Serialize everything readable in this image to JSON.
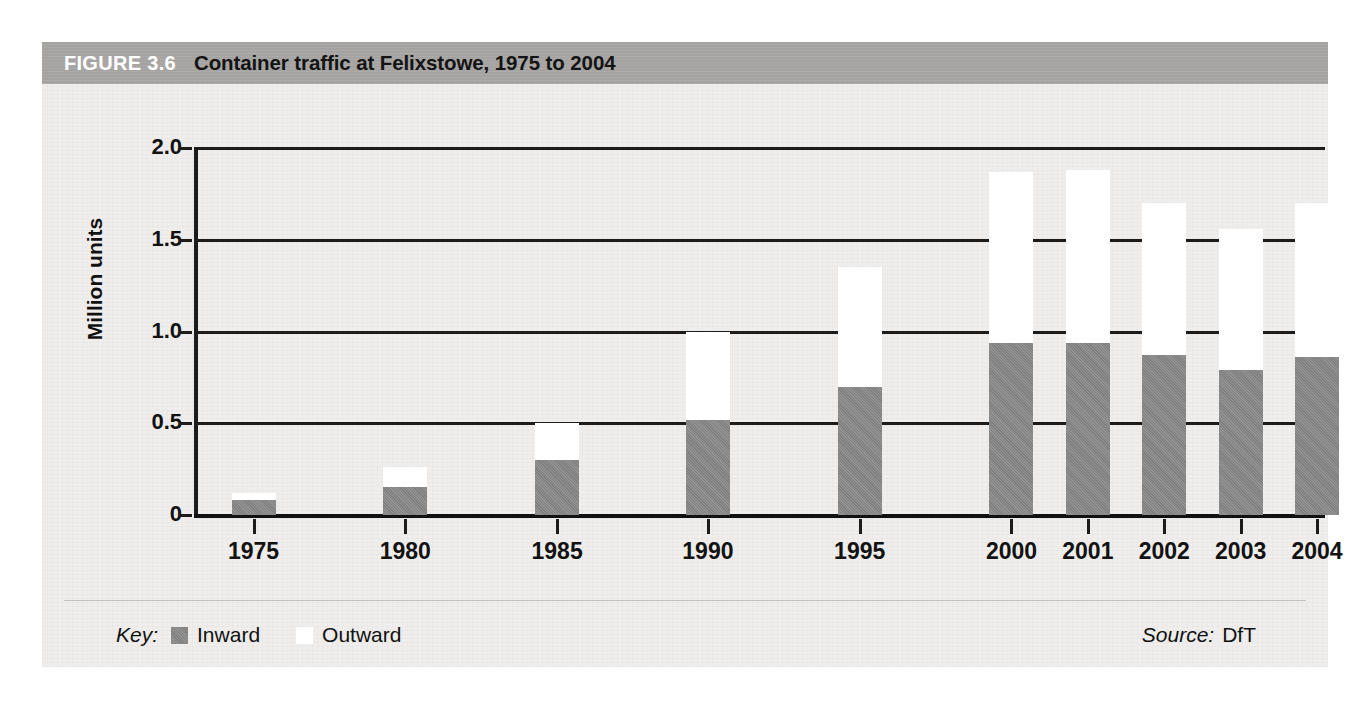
{
  "figure": {
    "number_label": "FIGURE 3.6",
    "title": "Container traffic at Felixstowe, 1975 to 2004"
  },
  "key": {
    "label": "Key:",
    "inward_label": "Inward",
    "outward_label": "Outward",
    "inward_color": "#808080",
    "outward_color": "#ffffff"
  },
  "source": {
    "label": "Source:",
    "value": "DfT"
  },
  "chart_data": {
    "type": "bar",
    "stacked": true,
    "title": "Container traffic at Felixstowe, 1975 to 2004",
    "xlabel": "",
    "ylabel": "Million units",
    "categories": [
      "1975",
      "1980",
      "1985",
      "1990",
      "1995",
      "2000",
      "2001",
      "2002",
      "2003",
      "2004"
    ],
    "series": [
      {
        "name": "Inward",
        "color": "#808080",
        "values": [
          0.08,
          0.15,
          0.3,
          0.52,
          0.7,
          0.94,
          0.94,
          0.87,
          0.79,
          0.86
        ]
      },
      {
        "name": "Outward",
        "color": "#ffffff",
        "values": [
          0.04,
          0.11,
          0.2,
          0.48,
          0.65,
          0.93,
          0.94,
          0.83,
          0.77,
          0.84
        ]
      }
    ],
    "totals": [
      0.12,
      0.26,
      0.5,
      1.0,
      1.35,
      1.87,
      1.88,
      1.7,
      1.56,
      1.7
    ],
    "ylim": [
      0,
      2.0
    ],
    "yticks": [
      "0",
      "0.5",
      "1.0",
      "1.5",
      "2.0"
    ],
    "ytick_values": [
      0,
      0.5,
      1.0,
      1.5,
      2.0
    ],
    "grid": true,
    "legend_position": "bottom-left"
  }
}
